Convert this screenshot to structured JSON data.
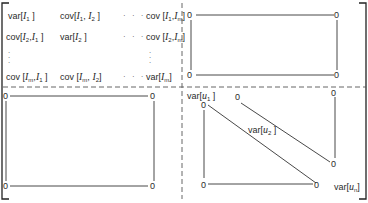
{
  "matrix": {
    "top_left_block": {
      "rows": [
        [
          "var[I_1]",
          "cov[I_1,I_2]",
          "···",
          "cov[I_1,I_m]"
        ],
        [
          "cov[I_2,I_1]",
          "var[I_2]",
          "···",
          "cov[I_2,I_m]"
        ],
        [
          ":",
          "",
          "",
          ":"
        ],
        [
          "cov[I_m,I_1]",
          "cov[I_m,I_2]",
          "···",
          "var[I_m]"
        ]
      ],
      "cells": {
        "r1c1": {
          "fn": "var",
          "a": "I",
          "as": "1"
        },
        "r1c2": {
          "fn": "cov",
          "a": "I",
          "as": "1",
          "b": "I",
          "bs": "2"
        },
        "r1c4": {
          "fn": "cov",
          "a": "I",
          "as": "1",
          "b": "I",
          "bs": "m"
        },
        "r2c1": {
          "fn": "cov",
          "a": "I",
          "as": "2",
          "b": "I",
          "bs": "1"
        },
        "r2c2": {
          "fn": "var",
          "a": "I",
          "as": "2"
        },
        "r2c4": {
          "fn": "cov",
          "a": "I",
          "as": "2",
          "b": "I",
          "bs": "m"
        },
        "r4c1": {
          "fn": "cov",
          "a": "I",
          "as": "m",
          "b": "I",
          "bs": "1"
        },
        "r4c2": {
          "fn": "cov",
          "a": "I",
          "as": "m",
          "b": "I",
          "bs": "2"
        },
        "r4c4": {
          "fn": "var",
          "a": "I",
          "as": "m"
        }
      },
      "ellipsis": "· · ·",
      "vellipsis": "·\n·\n·"
    },
    "top_right_block": {
      "corners": [
        "0",
        "0",
        "0",
        "0"
      ],
      "description": "zero block"
    },
    "bottom_left_block": {
      "corners": [
        "0",
        "0",
        "0",
        "0"
      ],
      "description": "zero block"
    },
    "bottom_right_block": {
      "diagonal": [
        {
          "fn": "var",
          "a": "u",
          "as": "1"
        },
        {
          "fn": "var",
          "a": "u",
          "as": "2"
        },
        {
          "fn": "var",
          "a": "u",
          "as": "n"
        }
      ],
      "zeros": [
        "0",
        "0",
        "0",
        "0",
        "0",
        "0"
      ],
      "description": "diagonal block, off-diagonal zeros"
    },
    "zero": "0"
  }
}
